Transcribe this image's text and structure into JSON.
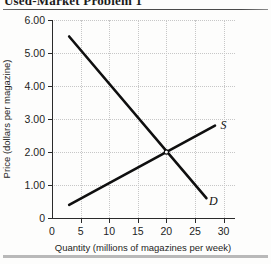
{
  "header": {
    "title": "Used-Market Problem 1",
    "truncated": true
  },
  "chart_data": {
    "type": "line",
    "title": "",
    "xlabel": "Quantity (millions of magazines per week)",
    "ylabel": "Price (dollars per magazine)",
    "xlim": [
      0,
      32
    ],
    "ylim": [
      0,
      6.0
    ],
    "grid": true,
    "legend_position": "inline-end-labels",
    "xticks": [
      "0",
      "5",
      "10",
      "15",
      "20",
      "25",
      "30"
    ],
    "xtick_values": [
      0,
      5,
      10,
      15,
      20,
      25,
      30
    ],
    "yticks": [
      "0",
      "1.00",
      "2.00",
      "3.00",
      "4.00",
      "5.00",
      "6.00"
    ],
    "ytick_values": [
      0,
      1.0,
      2.0,
      3.0,
      4.0,
      5.0,
      6.0
    ],
    "series": [
      {
        "name": "D",
        "label": "D",
        "description": "Demand curve",
        "x": [
          3,
          27
        ],
        "values": [
          5.5,
          0.6
        ],
        "label_x": 28.2,
        "label_y": 0.52
      },
      {
        "name": "S",
        "label": "S",
        "description": "Supply curve",
        "x": [
          3,
          28.5
        ],
        "values": [
          0.4,
          2.8
        ],
        "label_x": 30.0,
        "label_y": 2.82
      }
    ],
    "annotations": [
      {
        "name": "equilibrium-point",
        "x": 20,
        "y": 2.0,
        "marker": "open-circle"
      }
    ],
    "colors": {
      "line": "#0f0f0f",
      "grid": "#c7c7c7",
      "axis": "#2a2a2a",
      "background": "#fdfdfc"
    }
  }
}
